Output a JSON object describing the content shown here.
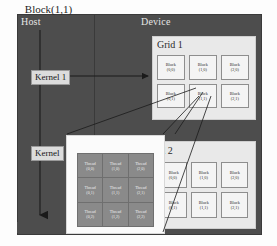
{
  "diagram": {
    "host": {
      "label": "Host"
    },
    "device": {
      "label": "Device"
    },
    "kernels": [
      {
        "id": "kernel1",
        "label": "Kernel 1"
      },
      {
        "id": "kernel2",
        "label": "Kernel"
      }
    ],
    "grids": [
      {
        "id": "grid1",
        "label": "Grid 1",
        "rows": 2,
        "cols": 3,
        "blocks": [
          {
            "name": "Block",
            "index": "(0,0)"
          },
          {
            "name": "Block",
            "index": "(1,0)"
          },
          {
            "name": "Block",
            "index": "(2,0)"
          },
          {
            "name": "Block",
            "index": "(0,1)"
          },
          {
            "name": "Block",
            "index": "(1,1)"
          },
          {
            "name": "Block",
            "index": "(2,1)"
          }
        ]
      },
      {
        "id": "grid2",
        "label": "Grid 2",
        "rows": 2,
        "cols": 3,
        "blocks": [
          {
            "name": "Block",
            "index": "(0,0)"
          },
          {
            "name": "Block",
            "index": "(1,0)"
          },
          {
            "name": "Block",
            "index": "(2,0)"
          },
          {
            "name": "Block",
            "index": "(0,1)"
          },
          {
            "name": "Block",
            "index": "(1,1)"
          },
          {
            "name": "Block",
            "index": "(2,1)"
          }
        ]
      }
    ],
    "detail": {
      "label": "Block(1,1)",
      "rows": 3,
      "cols": 3,
      "threads": [
        {
          "name": "Thread",
          "index": "(0,0)"
        },
        {
          "name": "Thread",
          "index": "(1,0)"
        },
        {
          "name": "Thread",
          "index": "(2,0)"
        },
        {
          "name": "Thread",
          "index": "(0,1)"
        },
        {
          "name": "Thread",
          "index": "(1,1)"
        },
        {
          "name": "Thread",
          "index": "(2,1)"
        },
        {
          "name": "Thread",
          "index": "(0,2)"
        },
        {
          "name": "Thread",
          "index": "(1,2)"
        },
        {
          "name": "Thread",
          "index": "(2,2)"
        }
      ]
    },
    "colors": {
      "host_fill": "#4d4d4d",
      "device_fill": "#4d4d4d",
      "grid_fill": "#e9e9e9",
      "block_fill": "#f4f4f4",
      "thread_fill": "#8a8a8a",
      "detail_fill": "#fbfbfb",
      "kernel_fill": "#dcdcdc",
      "line": "#2a2a2a"
    }
  }
}
